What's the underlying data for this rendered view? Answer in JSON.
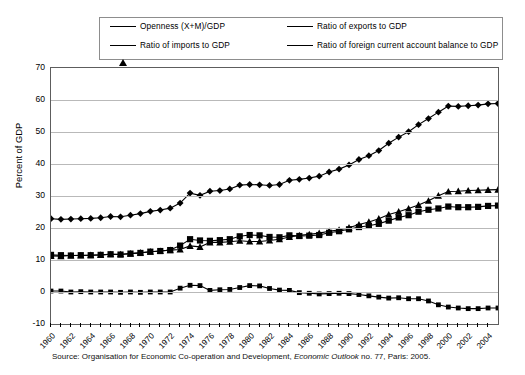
{
  "chart_data": {
    "type": "line",
    "title": "",
    "subtitle": "",
    "xlabel": "",
    "ylabel": "Percent of GDP",
    "ylim": [
      -10,
      70
    ],
    "ytick_step": 10,
    "yticks": [
      70,
      60,
      50,
      40,
      30,
      20,
      10,
      0,
      -10
    ],
    "grid": true,
    "legend_position": "top",
    "x": [
      1960,
      1961,
      1962,
      1963,
      1964,
      1965,
      1966,
      1967,
      1968,
      1969,
      1970,
      1971,
      1972,
      1973,
      1974,
      1975,
      1976,
      1977,
      1978,
      1979,
      1980,
      1981,
      1982,
      1983,
      1984,
      1985,
      1986,
      1987,
      1988,
      1989,
      1990,
      1991,
      1992,
      1993,
      1994,
      1995,
      1996,
      1997,
      1998,
      1999,
      2000,
      2001,
      2002,
      2003,
      2004,
      2005
    ],
    "xtick_labels": [
      "1960",
      "1962",
      "1964",
      "1966",
      "1968",
      "1970",
      "1972",
      "1974",
      "1976",
      "1978",
      "1980",
      "1982",
      "1984",
      "1986",
      "1988",
      "1990",
      "1992",
      "1994",
      "1996",
      "1998",
      "2000",
      "2002",
      "2004"
    ],
    "series": [
      {
        "name": "Openness (X+M)/GDP",
        "marker": "diamond",
        "values": [
          22.9,
          22.7,
          22.8,
          22.9,
          23.0,
          23.2,
          23.6,
          23.5,
          24.0,
          24.5,
          25.2,
          25.6,
          26.2,
          27.8,
          30.9,
          30.2,
          31.5,
          31.7,
          32.2,
          33.4,
          33.6,
          33.5,
          33.3,
          33.6,
          34.9,
          35.2,
          35.6,
          36.2,
          37.5,
          38.4,
          39.7,
          41.4,
          42.6,
          44.2,
          46.5,
          48.4,
          50.1,
          52.3,
          54.2,
          56.2,
          58.1,
          58.0,
          58.2,
          58.4,
          58.8,
          58.9
        ]
      },
      {
        "name": "Ratio of exports to GDP",
        "marker": "square-large",
        "values": [
          11.6,
          11.5,
          11.4,
          11.5,
          11.5,
          11.6,
          11.8,
          11.7,
          12.0,
          12.2,
          12.6,
          12.8,
          13.1,
          14.5,
          16.5,
          16.1,
          16.0,
          16.2,
          16.5,
          17.4,
          17.8,
          17.7,
          17.2,
          17.1,
          17.7,
          17.5,
          17.6,
          17.8,
          18.5,
          19.0,
          19.6,
          20.3,
          20.7,
          21.3,
          22.3,
          23.3,
          24.0,
          25.1,
          25.7,
          26.1,
          26.7,
          26.5,
          26.5,
          26.6,
          26.9,
          27.0
        ]
      },
      {
        "name": "Ratio of imports to GDP",
        "marker": "triangle",
        "values": [
          11.3,
          11.2,
          11.4,
          11.4,
          11.5,
          11.6,
          11.8,
          11.8,
          12.0,
          12.3,
          12.6,
          12.8,
          13.1,
          13.3,
          14.4,
          14.1,
          15.5,
          15.5,
          15.7,
          16.0,
          15.8,
          15.8,
          16.1,
          16.5,
          17.2,
          17.7,
          18.0,
          18.4,
          19.0,
          19.4,
          20.1,
          21.1,
          21.9,
          22.9,
          24.2,
          25.1,
          26.1,
          27.2,
          28.5,
          30.1,
          31.4,
          31.5,
          31.7,
          31.8,
          31.9,
          32.0
        ]
      },
      {
        "name": "Ratio of foreign current account balance to GDP",
        "marker": "square-small",
        "values": [
          0.3,
          0.3,
          0.0,
          0.1,
          0.0,
          0.0,
          0.0,
          -0.1,
          0.0,
          -0.1,
          0.0,
          0.0,
          0.0,
          1.2,
          2.1,
          2.0,
          0.5,
          0.7,
          0.8,
          1.4,
          2.0,
          1.9,
          1.1,
          0.6,
          0.5,
          -0.2,
          -0.4,
          -0.6,
          -0.5,
          -0.4,
          -0.5,
          -0.8,
          -1.2,
          -1.6,
          -1.9,
          -1.8,
          -2.1,
          -2.1,
          -2.8,
          -4.0,
          -4.7,
          -5.0,
          -5.2,
          -5.2,
          -5.0,
          -5.0
        ]
      }
    ]
  },
  "legend": {
    "items": [
      {
        "label": "Openness (X+M)/GDP",
        "marker": "diamond"
      },
      {
        "label": "Ratio of exports to GDP",
        "marker": "square-large"
      },
      {
        "label": "Ratio of imports to GDP",
        "marker": "triangle"
      },
      {
        "label": "Ratio of foreign current account balance to GDP",
        "marker": "square-small"
      }
    ]
  },
  "axes": {
    "y_title": "Percent of GDP"
  },
  "source": {
    "prefix": "Source: Organisation for Economic Co-operation and Development, ",
    "italic": "Economic Outlook",
    "suffix": " no. 77, Paris: 2005."
  },
  "colors": {
    "series": "#000000",
    "grid": "#b9b9b9",
    "frame": "#5d5d5d",
    "legend_border": "#8d8d8d",
    "background": "#ffffff"
  }
}
